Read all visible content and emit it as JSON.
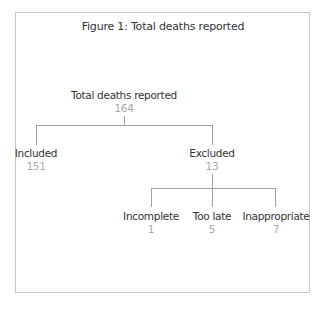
{
  "figure": {
    "title": "Figure 1: Total deaths reported"
  },
  "tree": {
    "root": {
      "label": "Total deaths reported",
      "value": "164"
    },
    "included": {
      "label": "Included",
      "value": "151"
    },
    "excluded": {
      "label": "Excluded",
      "value": "13"
    },
    "excluded_children": [
      {
        "label": "Incomplete",
        "value": "1"
      },
      {
        "label": "Too late",
        "value": "5"
      },
      {
        "label": "Inappropriate",
        "value": "7"
      }
    ]
  },
  "colors": {
    "label": "#333333",
    "value": "#a8a8a8",
    "line": "#a0a0a0",
    "border": "#c8c8c8"
  }
}
